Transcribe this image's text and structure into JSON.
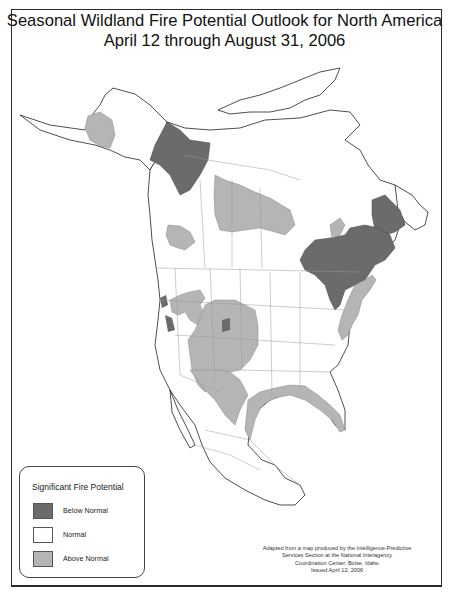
{
  "title": {
    "line1": "Seasonal Wildland Fire Potential Outlook for North America",
    "line2": "April 12 through August 31, 2006"
  },
  "legend": {
    "title": "Significant Fire Potential",
    "items": [
      {
        "label": "Below Normal",
        "color": "#6b6b6b"
      },
      {
        "label": "Normal",
        "color": "#ffffff"
      },
      {
        "label": "Above Normal",
        "color": "#b5b5b5"
      }
    ]
  },
  "credit": {
    "line1": "Adapted from a map produced by the Intelligence-Predictive",
    "line2": "Services Section at the National Interagency",
    "line3": "Coordination Center, Boise, Idaho",
    "line4": "Issued April 12, 2006"
  },
  "colors": {
    "below_normal": "#6b6b6b",
    "normal": "#ffffff",
    "above_normal": "#b5b5b5",
    "border": "#2a2a2a",
    "boundary_lines": "#9a9a9a"
  },
  "map_regions": {
    "below_normal": [
      "Yukon / western Northwest Territories",
      "Labrador",
      "Ontario / Quebec / Great Lakes"
    ],
    "above_normal": [
      "Western Alaska",
      "Saskatchewan / Manitoba",
      "Southern British Columbia",
      "Great Basin / Oregon",
      "Colorado / Southwest / Texas",
      "Gulf Coast & Florida",
      "Mid-Atlantic / Northeast coast",
      "Hudson Bay south shore"
    ]
  }
}
